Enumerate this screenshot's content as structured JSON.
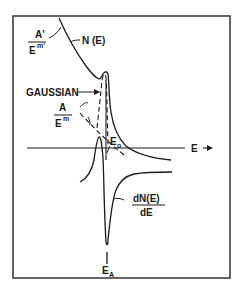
{
  "diagram": {
    "labels": {
      "background_upper_num": "A'",
      "background_upper_den": "E",
      "background_upper_exp": "m'",
      "n_of_e": "N (E)",
      "gaussian": "GAUSSIAN",
      "background_lower_num": "A",
      "background_lower_den": "E",
      "background_lower_exp": "m",
      "e0_base": "E",
      "e0_sub": "o",
      "axis_e": "E",
      "deriv_num": "dN(E)",
      "deriv_den": "dE",
      "ea_base": "E",
      "ea_sub": "A"
    },
    "colors": {
      "line": "#1a1a1a",
      "background": "#ffffff",
      "frame": "#333333"
    }
  }
}
